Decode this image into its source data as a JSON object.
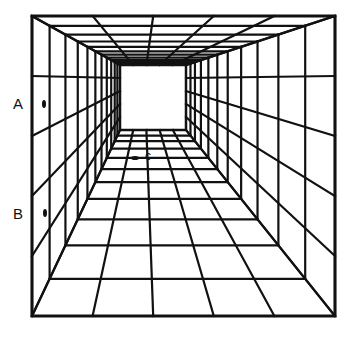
{
  "figure": {
    "type": "perspective-corridor-illusion",
    "line_color": "#111111",
    "background": "#ffffff",
    "outer_rect": {
      "x1": 32,
      "y1": 16,
      "x2": 335,
      "y2": 316
    },
    "inner_rect": {
      "x1": 120,
      "y1": 65,
      "x2": 186,
      "y2": 130
    },
    "columns": 5,
    "rows": 5,
    "depth_rings": [
      0,
      0.2,
      0.38,
      0.52,
      0.63,
      0.72,
      0.79,
      0.85,
      0.9,
      0.94,
      0.97
    ]
  },
  "labels": {
    "a": {
      "text": "A",
      "x": 13,
      "y": 96
    },
    "b": {
      "text": "B",
      "x": 13,
      "y": 206
    },
    "c": {
      "text": "c",
      "x": 145,
      "y": 150
    }
  },
  "markers": {
    "a": {
      "cx": 44,
      "cy": 104,
      "rx": 2,
      "ry": 4
    },
    "b": {
      "cx": 45,
      "cy": 213,
      "rx": 2,
      "ry": 4
    },
    "c": {
      "cx": 135,
      "cy": 158,
      "rx": 4,
      "ry": 2
    }
  }
}
